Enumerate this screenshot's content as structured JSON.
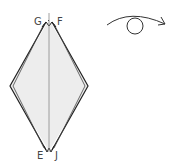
{
  "diagram": {
    "type": "origami-fold-step",
    "labels": {
      "top_left": "G",
      "top_right": "F",
      "bottom_left": "E",
      "bottom_right": "J"
    },
    "symbol": "turn-over",
    "colors": {
      "paper_fill": "#ededed",
      "outline": "#222222",
      "center_line": "#888888"
    }
  }
}
